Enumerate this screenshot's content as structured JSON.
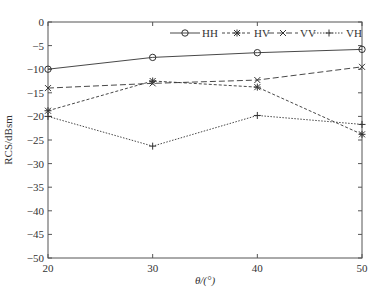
{
  "chart_data": {
    "type": "line",
    "title": "",
    "xlabel": "θ/(°)",
    "ylabel": "RCS/dBsm",
    "x": [
      20,
      30,
      40,
      50
    ],
    "xticks": [
      20,
      30,
      40,
      50
    ],
    "yticks": [
      0,
      -5,
      -10,
      -15,
      -20,
      -25,
      -30,
      -35,
      -40,
      -45,
      -50
    ],
    "xlim": [
      20,
      50
    ],
    "ylim": [
      -50,
      0
    ],
    "grid": false,
    "legend_position": "top-right, horizontal",
    "series": [
      {
        "name": "HH",
        "marker": "circle",
        "dash": "solid",
        "values": [
          -10,
          -7.5,
          -6.5,
          -5.8
        ]
      },
      {
        "name": "HV",
        "marker": "asterisk",
        "dash": "dashdot",
        "values": [
          -18.8,
          -12.5,
          -13.8,
          -23.8
        ]
      },
      {
        "name": "VV",
        "marker": "x",
        "dash": "dashed",
        "values": [
          -14,
          -13,
          -12.3,
          -9.5
        ]
      },
      {
        "name": "VH",
        "marker": "plus",
        "dash": "dotted",
        "values": [
          -20,
          -26.3,
          -19.8,
          -21.7
        ]
      }
    ]
  }
}
